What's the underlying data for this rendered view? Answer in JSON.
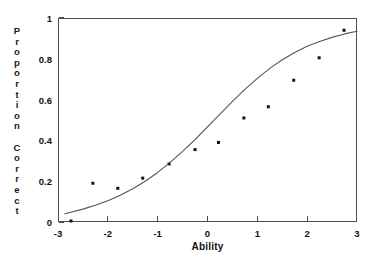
{
  "chart_data": {
    "type": "scatter",
    "title": "",
    "xlabel": "Ability",
    "ylabel": "Proportion Correct",
    "ylabel_glyphs": [
      "P",
      "r",
      "o",
      "p",
      "o",
      "r",
      "t",
      "i",
      "o",
      "n",
      " ",
      "C",
      "o",
      "r",
      "r",
      "e",
      "c",
      "t"
    ],
    "xlim": [
      -3,
      3
    ],
    "ylim": [
      0,
      1
    ],
    "xticks": [
      -3,
      -2,
      -1,
      0,
      1,
      2,
      3
    ],
    "xtick_labels": [
      "-3",
      "-2",
      "-1",
      "0",
      "1",
      "2",
      "3"
    ],
    "yticks": [
      0,
      0.2,
      0.4,
      0.6,
      0.8,
      1
    ],
    "ytick_labels": [
      "0",
      "0.2",
      "0.4",
      "0.6",
      "0.8",
      "1"
    ],
    "grid": false,
    "legend": false,
    "series": [
      {
        "name": "Observed proportion correct",
        "type": "scatter",
        "marker": "square",
        "marker_size": 3,
        "color": "#111111",
        "points": [
          {
            "x": -2.74,
            "y": 0.005
          },
          {
            "x": -2.3,
            "y": 0.19
          },
          {
            "x": -1.8,
            "y": 0.165
          },
          {
            "x": -1.3,
            "y": 0.215
          },
          {
            "x": -0.77,
            "y": 0.285
          },
          {
            "x": -0.25,
            "y": 0.355
          },
          {
            "x": 0.22,
            "y": 0.39
          },
          {
            "x": 0.73,
            "y": 0.51
          },
          {
            "x": 1.22,
            "y": 0.565
          },
          {
            "x": 1.73,
            "y": 0.695
          },
          {
            "x": 2.24,
            "y": 0.805
          },
          {
            "x": 2.74,
            "y": 0.94
          }
        ]
      },
      {
        "name": "Fitted logistic curve",
        "type": "line",
        "color": "#555555",
        "line_width": 1.1,
        "points": [
          {
            "x": -2.86,
            "y": 0.04
          },
          {
            "x": -2.7,
            "y": 0.05
          },
          {
            "x": -2.5,
            "y": 0.063
          },
          {
            "x": -2.25,
            "y": 0.082
          },
          {
            "x": -2.0,
            "y": 0.104
          },
          {
            "x": -1.75,
            "y": 0.131
          },
          {
            "x": -1.5,
            "y": 0.163
          },
          {
            "x": -1.25,
            "y": 0.2
          },
          {
            "x": -1.0,
            "y": 0.243
          },
          {
            "x": -0.75,
            "y": 0.292
          },
          {
            "x": -0.5,
            "y": 0.346
          },
          {
            "x": -0.25,
            "y": 0.404
          },
          {
            "x": 0.0,
            "y": 0.466
          },
          {
            "x": 0.25,
            "y": 0.529
          },
          {
            "x": 0.5,
            "y": 0.591
          },
          {
            "x": 0.75,
            "y": 0.65
          },
          {
            "x": 1.0,
            "y": 0.704
          },
          {
            "x": 1.25,
            "y": 0.753
          },
          {
            "x": 1.5,
            "y": 0.795
          },
          {
            "x": 1.75,
            "y": 0.831
          },
          {
            "x": 2.0,
            "y": 0.861
          },
          {
            "x": 2.25,
            "y": 0.885
          },
          {
            "x": 2.5,
            "y": 0.905
          },
          {
            "x": 2.75,
            "y": 0.922
          },
          {
            "x": 3.0,
            "y": 0.935
          }
        ]
      }
    ]
  },
  "axes": {
    "frame_color": "#4d4d4d"
  }
}
